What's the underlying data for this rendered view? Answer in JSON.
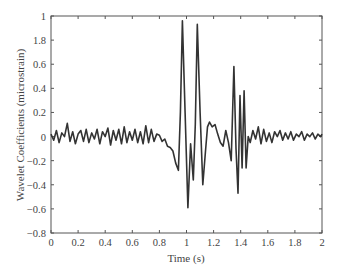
{
  "chart_data": {
    "type": "line",
    "title": "",
    "xlabel": "Time (s)",
    "ylabel": "Wavelet Coefficients (microstrain)",
    "xlim": [
      0,
      2
    ],
    "ylim": [
      -0.8,
      1
    ],
    "grid": false,
    "legend": null,
    "x_ticks": [
      0,
      0.2,
      0.4,
      0.6,
      0.8,
      1,
      1.2,
      1.4,
      1.6,
      1.8,
      2
    ],
    "x_tick_labels": [
      "0",
      "0.2",
      "0.4",
      "0.6",
      "0.8",
      "1",
      "1.2",
      "1.4",
      "1.6",
      "1.8",
      "2"
    ],
    "y_ticks": [
      1,
      0.8,
      0.6,
      0.4,
      0.2,
      0,
      -0.2,
      -0.4,
      -0.6,
      -0.8
    ],
    "y_tick_labels": [
      "1",
      "1.8",
      "0.6",
      "0.4",
      "0.2",
      "0",
      "−0.2",
      "−0.4",
      "−0.6",
      "−0.8"
    ],
    "line_color": "#333333",
    "series": [
      {
        "name": "wavelet coefficients",
        "x": [
          0,
          0.02,
          0.04,
          0.06,
          0.08,
          0.1,
          0.12,
          0.14,
          0.16,
          0.18,
          0.2,
          0.22,
          0.24,
          0.26,
          0.28,
          0.3,
          0.32,
          0.34,
          0.36,
          0.38,
          0.4,
          0.42,
          0.44,
          0.46,
          0.48,
          0.5,
          0.52,
          0.54,
          0.56,
          0.58,
          0.6,
          0.62,
          0.64,
          0.66,
          0.68,
          0.7,
          0.72,
          0.74,
          0.76,
          0.78,
          0.8,
          0.82,
          0.84,
          0.86,
          0.88,
          0.9,
          0.92,
          0.94,
          0.955,
          0.97,
          0.99,
          1.01,
          1.03,
          1.05,
          1.065,
          1.08,
          1.1,
          1.12,
          1.14,
          1.155,
          1.17,
          1.19,
          1.21,
          1.23,
          1.25,
          1.27,
          1.29,
          1.31,
          1.33,
          1.35,
          1.365,
          1.38,
          1.395,
          1.41,
          1.425,
          1.44,
          1.455,
          1.47,
          1.49,
          1.51,
          1.53,
          1.55,
          1.57,
          1.59,
          1.61,
          1.63,
          1.65,
          1.67,
          1.69,
          1.71,
          1.73,
          1.75,
          1.77,
          1.79,
          1.81,
          1.83,
          1.85,
          1.87,
          1.89,
          1.91,
          1.93,
          1.95,
          1.97,
          1.99,
          2.0
        ],
        "y": [
          0.02,
          -0.03,
          0.05,
          -0.05,
          0.03,
          0.0,
          0.11,
          -0.04,
          0.04,
          -0.06,
          0.02,
          0.05,
          -0.04,
          0.06,
          -0.05,
          0.03,
          -0.02,
          0.06,
          -0.06,
          0.04,
          0.0,
          0.07,
          -0.07,
          0.05,
          -0.03,
          0.06,
          -0.06,
          0.08,
          -0.05,
          0.04,
          -0.03,
          0.06,
          -0.05,
          0.04,
          -0.06,
          0.09,
          -0.05,
          0.06,
          -0.04,
          0.02,
          0.01,
          -0.04,
          -0.02,
          -0.08,
          -0.09,
          -0.12,
          -0.22,
          -0.28,
          0.2,
          0.96,
          0.2,
          -0.59,
          -0.06,
          -0.36,
          0.1,
          0.93,
          0.2,
          -0.4,
          -0.12,
          0.08,
          0.12,
          0.08,
          0.1,
          0.02,
          -0.05,
          -0.08,
          0.05,
          -0.05,
          -0.2,
          0.58,
          -0.1,
          -0.47,
          0.34,
          -0.26,
          0.38,
          -0.26,
          0.0,
          -0.05,
          0.05,
          -0.02,
          0.08,
          -0.06,
          0.06,
          -0.04,
          0.03,
          -0.05,
          0.04,
          0.0,
          0.05,
          -0.03,
          0.03,
          -0.02,
          0.04,
          -0.03,
          0.02,
          0.0,
          0.04,
          -0.03,
          0.02,
          0.0,
          0.03,
          -0.02,
          0.02,
          0.0,
          0.02
        ]
      }
    ]
  }
}
